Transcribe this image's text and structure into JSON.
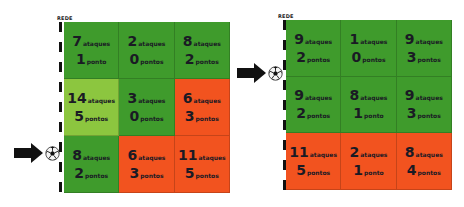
{
  "colors": {
    "high_green": "#3f9b2c",
    "mid_green": "#8cc63f",
    "low_red": "#f2531f",
    "text": "#1a1a24"
  },
  "courts": [
    {
      "net_label": "REDE",
      "serve_row": 3,
      "cells": [
        [
          {
            "ataques": "7",
            "ataques_label": "ataques",
            "pontos": "1",
            "pontos_label": "ponto",
            "color": "high_green"
          },
          {
            "ataques": "2",
            "ataques_label": "ataques",
            "pontos": "0",
            "pontos_label": "pontos",
            "color": "high_green"
          },
          {
            "ataques": "8",
            "ataques_label": "ataques",
            "pontos": "2",
            "pontos_label": "pontos",
            "color": "high_green"
          }
        ],
        [
          {
            "ataques": "14",
            "ataques_label": "ataques",
            "pontos": "5",
            "pontos_label": "pontos",
            "color": "mid_green"
          },
          {
            "ataques": "3",
            "ataques_label": "ataques",
            "pontos": "0",
            "pontos_label": "pontos",
            "color": "high_green"
          },
          {
            "ataques": "6",
            "ataques_label": "ataques",
            "pontos": "3",
            "pontos_label": "pontos",
            "color": "low_red"
          }
        ],
        [
          {
            "ataques": "8",
            "ataques_label": "ataques",
            "pontos": "2",
            "pontos_label": "pontos",
            "color": "high_green"
          },
          {
            "ataques": "6",
            "ataques_label": "ataques",
            "pontos": "3",
            "pontos_label": "pontos",
            "color": "low_red"
          },
          {
            "ataques": "11",
            "ataques_label": "ataques",
            "pontos": "5",
            "pontos_label": "pontos",
            "color": "low_red"
          }
        ]
      ]
    },
    {
      "net_label": "REDE",
      "serve_row": 1,
      "cells": [
        [
          {
            "ataques": "9",
            "ataques_label": "ataques",
            "pontos": "2",
            "pontos_label": "pontos",
            "color": "high_green"
          },
          {
            "ataques": "1",
            "ataques_label": "ataques",
            "pontos": "0",
            "pontos_label": "pontos",
            "color": "high_green"
          },
          {
            "ataques": "9",
            "ataques_label": "ataques",
            "pontos": "3",
            "pontos_label": "pontos",
            "color": "high_green"
          }
        ],
        [
          {
            "ataques": "9",
            "ataques_label": "ataques",
            "pontos": "2",
            "pontos_label": "pontos",
            "color": "high_green"
          },
          {
            "ataques": "8",
            "ataques_label": "ataques",
            "pontos": "1",
            "pontos_label": "ponto",
            "color": "high_green"
          },
          {
            "ataques": "9",
            "ataques_label": "ataques",
            "pontos": "3",
            "pontos_label": "pontos",
            "color": "high_green"
          }
        ],
        [
          {
            "ataques": "11",
            "ataques_label": "ataques",
            "pontos": "5",
            "pontos_label": "pontos",
            "color": "low_red"
          },
          {
            "ataques": "2",
            "ataques_label": "ataques",
            "pontos": "1",
            "pontos_label": "ponto",
            "color": "low_red"
          },
          {
            "ataques": "8",
            "ataques_label": "ataques",
            "pontos": "4",
            "pontos_label": "pontos",
            "color": "low_red"
          }
        ]
      ]
    }
  ]
}
